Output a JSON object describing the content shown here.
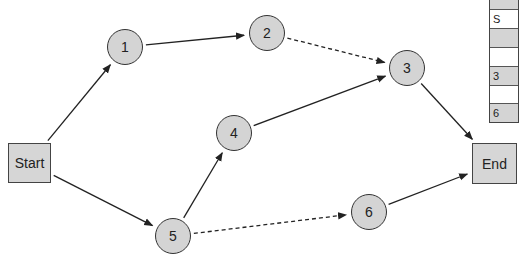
{
  "diagram": {
    "type": "network-diagram",
    "start": {
      "label": "Start",
      "x": 8,
      "y": 143,
      "w": 43,
      "h": 40
    },
    "end": {
      "label": "End",
      "x": 472,
      "y": 143,
      "w": 45,
      "h": 41
    },
    "nodes": [
      {
        "id": "1",
        "label": "1",
        "cx": 125,
        "cy": 47
      },
      {
        "id": "2",
        "label": "2",
        "cx": 267,
        "cy": 33
      },
      {
        "id": "3",
        "label": "3",
        "cx": 407,
        "cy": 68
      },
      {
        "id": "4",
        "label": "4",
        "cx": 234,
        "cy": 133
      },
      {
        "id": "5",
        "label": "5",
        "cx": 173,
        "cy": 236
      },
      {
        "id": "6",
        "label": "6",
        "cx": 369,
        "cy": 212
      }
    ],
    "edges": [
      {
        "from": "Start",
        "to": "1",
        "style": "solid"
      },
      {
        "from": "Start",
        "to": "5",
        "style": "solid"
      },
      {
        "from": "1",
        "to": "2",
        "style": "solid"
      },
      {
        "from": "2",
        "to": "3",
        "style": "dashed"
      },
      {
        "from": "4",
        "to": "3",
        "style": "solid"
      },
      {
        "from": "5",
        "to": "4",
        "style": "solid"
      },
      {
        "from": "5",
        "to": "6",
        "style": "dashed"
      },
      {
        "from": "3",
        "to": "End",
        "style": "solid"
      },
      {
        "from": "6",
        "to": "End",
        "style": "solid"
      }
    ],
    "colors": {
      "fill": "#d4d4d4",
      "stroke": "#333333",
      "background": "#ffffff"
    }
  },
  "partial_table": {
    "rows": [
      {
        "text": "",
        "shade": "gray",
        "h": 10
      },
      {
        "text": "S",
        "shade": "white",
        "h": 19
      },
      {
        "text": "",
        "shade": "gray",
        "h": 19
      },
      {
        "text": "",
        "shade": "white",
        "h": 19
      },
      {
        "text": "3",
        "shade": "gray",
        "h": 19
      },
      {
        "text": "",
        "shade": "white",
        "h": 18
      },
      {
        "text": "6",
        "shade": "gray",
        "h": 18
      }
    ]
  }
}
